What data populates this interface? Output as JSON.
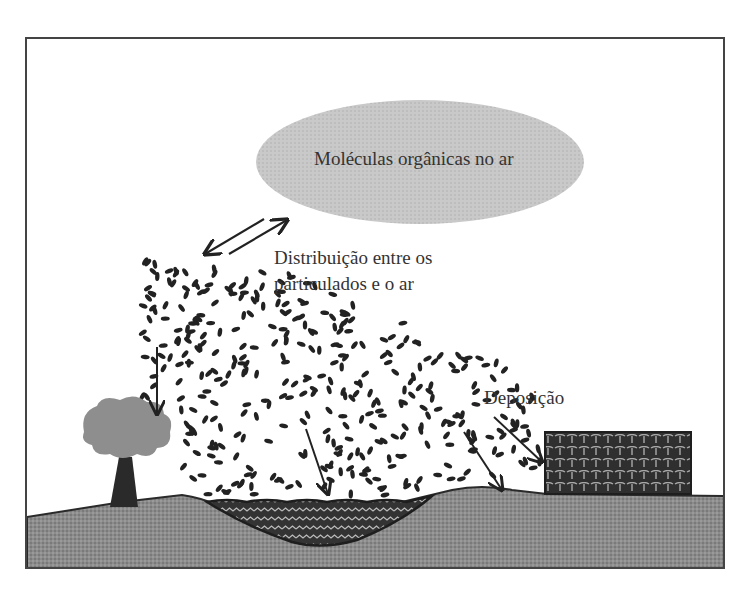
{
  "diagram": {
    "cloud_label": "Moléculas orgânicas no ar",
    "distribution_label_line1": "Distribuição entre os",
    "distribution_label_line2": "particulados e o ar",
    "deposition_label": "Deposição",
    "colors": {
      "cloud": "#c8c8c8",
      "ground": "#8a8a8a",
      "water": "#3a3a3a",
      "building": "#2e2e2e",
      "tree_canopy": "#8e8e8e",
      "tree_trunk": "#2a2a2a",
      "particles": "#222222",
      "frame": "#444444"
    },
    "elements": [
      "air cloud",
      "particles",
      "tree",
      "water body",
      "building",
      "ground",
      "deposition arrows",
      "equilibrium arrows"
    ]
  }
}
